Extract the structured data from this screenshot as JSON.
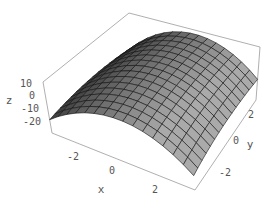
{
  "chart_data": {
    "type": "surface3d",
    "title": "",
    "function_hint": "concave-down dome, z decreases away from center mostly along x",
    "x": {
      "label": "x",
      "range": [
        -3,
        3
      ],
      "ticks": [
        -2,
        0,
        2
      ],
      "tick_labels": [
        "-2",
        "0",
        "2"
      ]
    },
    "y": {
      "label": "y",
      "range": [
        -3,
        3
      ],
      "ticks": [
        -2,
        0,
        2
      ],
      "tick_labels": [
        "-2",
        "0",
        "2"
      ]
    },
    "z": {
      "label": "z",
      "range": [
        -25,
        12
      ],
      "ticks": [
        10,
        0,
        -10,
        -20
      ],
      "tick_labels": [
        "10",
        "0",
        "-10",
        "-20"
      ]
    },
    "grid": {
      "mesh_lines": 15
    },
    "box": true,
    "colors": {
      "surface_light": "#a8a8a8",
      "surface_dark": "#3a3a3a",
      "mesh": "#111111",
      "box": "#9a9a9a",
      "text": "#555555"
    }
  }
}
